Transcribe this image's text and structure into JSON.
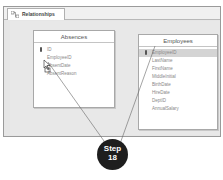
{
  "tab": {
    "label": "Relationships",
    "icon": "relationships-icon"
  },
  "tables": [
    {
      "title": "Absences",
      "fields": [
        {
          "name": "ID",
          "primary_key": true
        },
        {
          "name": "EmployeeID",
          "primary_key": false
        },
        {
          "name": "AbsentDate",
          "primary_key": false
        },
        {
          "name": "AbsentReason",
          "primary_key": false
        }
      ]
    },
    {
      "title": "Employees",
      "fields": [
        {
          "name": "EmployeeID",
          "primary_key": true,
          "selected": true
        },
        {
          "name": "LastName",
          "primary_key": false
        },
        {
          "name": "FirstName",
          "primary_key": false
        },
        {
          "name": "MiddleInitial",
          "primary_key": false
        },
        {
          "name": "BirthDate",
          "primary_key": false
        },
        {
          "name": "HireDate",
          "primary_key": false
        },
        {
          "name": "DeptID",
          "primary_key": false
        },
        {
          "name": "AnnualSalary",
          "primary_key": false
        }
      ]
    }
  ],
  "callout": {
    "line1": "Step",
    "line2": "18",
    "color": "#1e1e1e"
  },
  "cursor": {
    "icon": "drag-field-cursor-icon"
  }
}
